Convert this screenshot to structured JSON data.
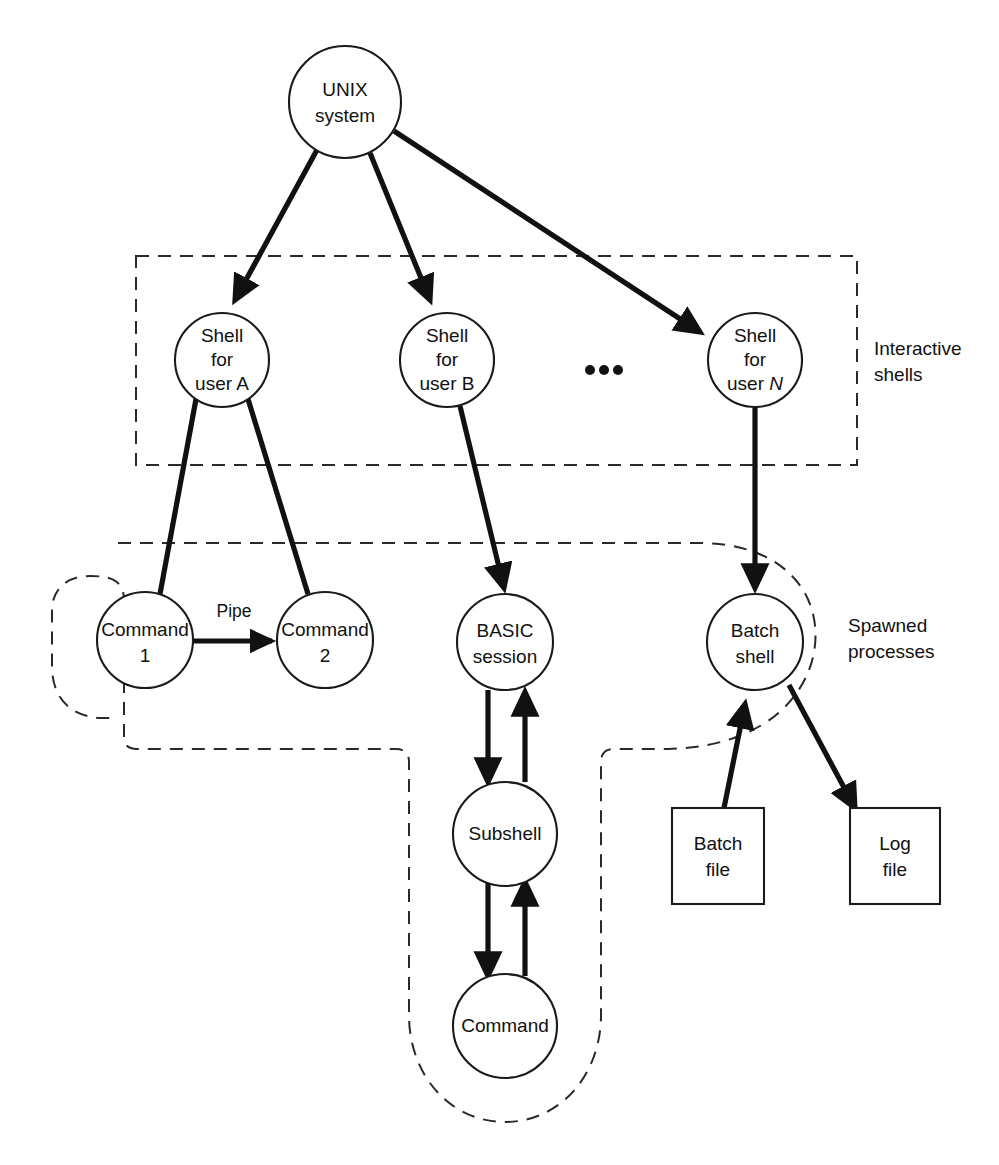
{
  "figure": {
    "kind": "diagram",
    "background_color": "#ffffff",
    "ink_color": "#111111"
  },
  "nodes": {
    "unix_system": {
      "line1": "UNIX",
      "line2": "system"
    },
    "shell_a": {
      "line1": "Shell",
      "line2": "for",
      "line3": "user A"
    },
    "shell_b": {
      "line1": "Shell",
      "line2": "for",
      "line3": "user B"
    },
    "shell_n": {
      "line1": "Shell",
      "line2": "for",
      "line3_prefix": "user ",
      "line3_italic": "N"
    },
    "command_1": {
      "line1": "Command",
      "line2": "1"
    },
    "command_2": {
      "line1": "Command",
      "line2": "2"
    },
    "basic_session": {
      "line1": "BASIC",
      "line2": "session"
    },
    "batch_shell": {
      "line1": "Batch",
      "line2": "shell"
    },
    "subshell": {
      "line1": "Subshell"
    },
    "command": {
      "line1": "Command"
    },
    "batch_file": {
      "line1": "Batch",
      "line2": "file"
    },
    "log_file": {
      "line1": "Log",
      "line2": "file"
    }
  },
  "edge_labels": {
    "pipe": "Pipe"
  },
  "groups": {
    "interactive_shells": {
      "line1": "Interactive",
      "line2": "shells",
      "border_style": "dashed-rectangle"
    },
    "spawned_processes": {
      "line1": "Spawned",
      "line2": "processes",
      "border_style": "dashed-rounded-blob"
    }
  },
  "ellipsis": {
    "glyph": "•",
    "count": 3
  }
}
